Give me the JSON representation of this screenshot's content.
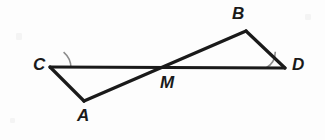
{
  "figure": {
    "background_color": "#fdfdfd",
    "stroke_color": "#1a1a1a",
    "arc_color": "#8c8c8c",
    "stroke_width": 3.2,
    "arc_width": 1.6,
    "points": {
      "C": {
        "x": 50,
        "y": 67
      },
      "A": {
        "x": 84,
        "y": 101
      },
      "M": {
        "x": 166,
        "y": 68
      },
      "B": {
        "x": 246,
        "y": 31
      },
      "D": {
        "x": 285,
        "y": 68
      }
    },
    "segments": [
      {
        "name": "segment-CD",
        "from": "C",
        "to": "D"
      },
      {
        "name": "segment-AB",
        "from": "A",
        "to": "B"
      },
      {
        "name": "segment-CA",
        "from": "C",
        "to": "A"
      },
      {
        "name": "segment-BD",
        "from": "B",
        "to": "D"
      }
    ],
    "angle_marks": [
      {
        "name": "angle-arc-C",
        "vertex": "C",
        "radius": 21
      },
      {
        "name": "angle-arc-D",
        "vertex": "D",
        "radius": 19
      }
    ]
  },
  "labels": {
    "C": {
      "text": "C",
      "x": 33,
      "y": 56
    },
    "A": {
      "text": "A",
      "x": 77,
      "y": 107
    },
    "M": {
      "text": "M",
      "x": 160,
      "y": 74
    },
    "B": {
      "text": "B",
      "x": 232,
      "y": 5
    },
    "D": {
      "text": "D",
      "x": 292,
      "y": 56
    }
  },
  "paths": {
    "line_CD": "M 50 67 L 285 68",
    "line_AB": "M 84 101 L 246 31",
    "line_CA": "M 50 67 L 84 101",
    "line_BD": "M 246 31 L 285 68",
    "arc_C": "M 71 68 A 21 21 0 0 0 63.6 52.2",
    "arc_D": "M 266 68 A 19 19 0 0 0 275.3 51.7"
  }
}
